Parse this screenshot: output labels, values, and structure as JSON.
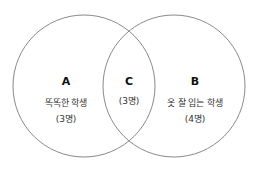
{
  "diagram": {
    "type": "venn",
    "stroke_color": "#8a8a8a",
    "sets": [
      {
        "id": "A",
        "letter": "A",
        "label": "똑똑한 학생",
        "count": "(3명)"
      },
      {
        "id": "B",
        "letter": "B",
        "label": "옷 잘 입는 학생",
        "count": "(4명)"
      }
    ],
    "intersection": {
      "letter": "C",
      "count": "(3명)"
    }
  }
}
